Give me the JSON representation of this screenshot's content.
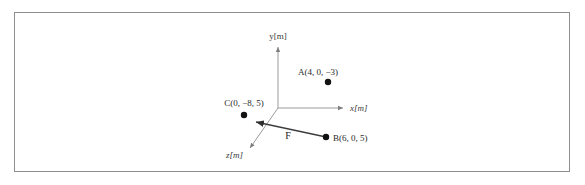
{
  "figure": {
    "type": "3d-coordinate-diagram",
    "border_color": "#8e8e8e",
    "background_color": "#ffffff",
    "axes": {
      "x_label": "x[m]",
      "y_label": "y[m]",
      "z_label": "z[m]",
      "origin_px": [
        278,
        108
      ],
      "x_end_px": [
        345,
        108
      ],
      "y_end_px": [
        278,
        45
      ],
      "z_end_px": [
        248,
        150
      ],
      "color": "#9a9a9a"
    },
    "points": [
      {
        "id": "A",
        "label": "A(4, 0, −3)",
        "coords": [
          4,
          0,
          -3
        ],
        "dot_px": [
          328,
          82
        ],
        "label_px": [
          318,
          75
        ],
        "label_anchor": "middle"
      },
      {
        "id": "C",
        "label": "C(0, −8, 5)",
        "coords": [
          0,
          -8,
          5
        ],
        "dot_px": [
          244,
          115
        ],
        "label_px": [
          244,
          106
        ],
        "label_anchor": "middle"
      },
      {
        "id": "B",
        "label": "B(6, 0, 5)",
        "coords": [
          6,
          0,
          5
        ],
        "dot_px": [
          326,
          137
        ],
        "label_px": [
          333,
          141
        ],
        "label_anchor": "start"
      }
    ],
    "vector": {
      "id": "F",
      "label": "F",
      "from_point": "B",
      "to_point": "C",
      "start_px": [
        326,
        137
      ],
      "end_px": [
        253,
        121
      ],
      "label_px": [
        288,
        136
      ],
      "color": "#3d3d3d"
    }
  }
}
